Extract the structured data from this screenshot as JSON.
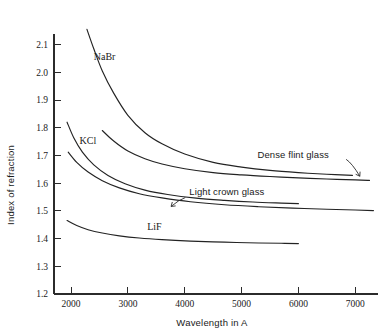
{
  "chart_data": {
    "type": "line",
    "title": "",
    "xlabel": "Wavelength in A",
    "ylabel": "Index of refraction",
    "xlim": [
      1700,
      7400
    ],
    "ylim": [
      1.2,
      2.16
    ],
    "grid": false,
    "legend": "inline-annotations",
    "xticks": [
      2000,
      3000,
      4000,
      5000,
      6000,
      7000
    ],
    "xticklabels": [
      "2000",
      "3000",
      "4000",
      "5000",
      "6000",
      "7000"
    ],
    "yticks": [
      1.2,
      1.3,
      1.4,
      1.5,
      1.6,
      1.7,
      1.8,
      1.9,
      2.0,
      2.1
    ],
    "yticklabels": [
      "1.2",
      "1.3",
      "1.4",
      "1.5",
      "1.6",
      "1.7",
      "1.8",
      "1.9",
      "2.0",
      "2.1"
    ],
    "series": [
      {
        "name": "NaBr",
        "label": "NaBr",
        "label_style": "serif",
        "label_x": 2400,
        "label_y": 2.045,
        "x": [
          2280,
          2400,
          2550,
          2750,
          3000,
          3300,
          3600,
          4000,
          4500,
          5000,
          5500,
          6000,
          6500,
          6950
        ],
        "y": [
          2.155,
          2.085,
          2.005,
          1.925,
          1.845,
          1.782,
          1.742,
          1.705,
          1.675,
          1.658,
          1.646,
          1.638,
          1.632,
          1.628
        ]
      },
      {
        "name": "Dense flint glass",
        "label": "Dense flint glass",
        "label_style": "sans",
        "label_x": 5280,
        "label_y": 1.692,
        "leader": {
          "x1": 6840,
          "y1": 1.686,
          "x2": 7080,
          "y2": 1.625
        },
        "x": [
          2550,
          2750,
          3000,
          3300,
          3600,
          4000,
          4500,
          5000,
          5500,
          6000,
          6500,
          7000,
          7250
        ],
        "y": [
          1.79,
          1.752,
          1.716,
          1.688,
          1.669,
          1.652,
          1.638,
          1.63,
          1.624,
          1.619,
          1.615,
          1.612,
          1.61
        ]
      },
      {
        "name": "KCl",
        "label": "KCl",
        "label_style": "serif",
        "label_x": 2150,
        "label_y": 1.742,
        "x": [
          1930,
          2050,
          2200,
          2400,
          2650,
          2950,
          3300,
          3700,
          4200,
          4700,
          5200,
          5700,
          6000
        ],
        "y": [
          1.82,
          1.763,
          1.712,
          1.666,
          1.628,
          1.598,
          1.575,
          1.559,
          1.546,
          1.538,
          1.532,
          1.528,
          1.526
        ]
      },
      {
        "name": "Light crown glass",
        "label": "Light crown glass",
        "label_style": "sans",
        "label_x": 4080,
        "label_y": 1.559,
        "leader": {
          "x1": 4010,
          "y1": 1.548,
          "x2": 3760,
          "y2": 1.516
        },
        "x": [
          1950,
          2100,
          2300,
          2550,
          2850,
          3200,
          3600,
          4100,
          4700,
          5300,
          5900,
          6500,
          7000,
          7320
        ],
        "y": [
          1.712,
          1.675,
          1.64,
          1.609,
          1.583,
          1.562,
          1.547,
          1.533,
          1.522,
          1.515,
          1.51,
          1.506,
          1.503,
          1.501
        ]
      },
      {
        "name": "LiF",
        "label": "LiF",
        "label_style": "serif",
        "label_x": 3340,
        "label_y": 1.432,
        "x": [
          1930,
          2100,
          2300,
          2550,
          2850,
          3200,
          3600,
          4100,
          4700,
          5300,
          5700,
          6000
        ],
        "y": [
          1.465,
          1.447,
          1.432,
          1.42,
          1.41,
          1.402,
          1.396,
          1.391,
          1.387,
          1.384,
          1.383,
          1.382
        ]
      }
    ]
  }
}
